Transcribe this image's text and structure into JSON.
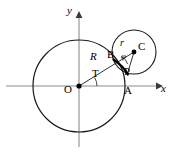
{
  "figure": {
    "background_color": "#ffffff",
    "stroke_color": "#1a1a1a",
    "axis_color": "#808080",
    "width": 180,
    "height": 153
  },
  "axes": {
    "x_label": "x",
    "y_label": "y",
    "origin_label": "O",
    "x_axis_y": 86,
    "y_axis_x": 79,
    "x_axis_start": 6,
    "x_axis_end": 160,
    "y_axis_top": 14,
    "y_axis_bottom": 147
  },
  "large_circle": {
    "name": "fixed-circle",
    "center_x": 79,
    "center_y": 86,
    "radius": 46,
    "radius_label": "R"
  },
  "small_circle": {
    "name": "rolling-circle",
    "center_x": 134,
    "center_y": 52,
    "radius": 22,
    "radius_label": "r",
    "center_label": "C"
  },
  "points": [
    {
      "label": "O",
      "x": 79,
      "y": 86,
      "dot": true,
      "label_x": 68,
      "label_y": 89
    },
    {
      "label": "A",
      "x": 125,
      "y": 86,
      "dot": false,
      "label_x": 126,
      "label_y": 90
    },
    {
      "label": "B",
      "x": 116,
      "y": 62,
      "dot": false,
      "label_x": 110,
      "label_y": 54
    },
    {
      "label": "P",
      "x": 127,
      "y": 74,
      "dot": false,
      "label_x": 125,
      "label_y": 73
    },
    {
      "label": "C",
      "x": 134,
      "y": 52,
      "dot": true,
      "label_x": 139,
      "label_y": 47
    }
  ],
  "angles": [
    {
      "label": "T",
      "name": "theta",
      "vertex": "O",
      "label_x": 94,
      "label_y": 74
    },
    {
      "label": "φ",
      "name": "phi",
      "vertex": "C",
      "label_x": 124,
      "label_y": 58
    }
  ],
  "segments": [
    {
      "name": "radius-R-segment",
      "from": "O",
      "to": "C",
      "label": "R"
    },
    {
      "name": "radius-r-segment",
      "from": "B",
      "to": "C",
      "label": "r"
    },
    {
      "name": "chord-CP-segment",
      "from": "C",
      "to": "P",
      "label": ""
    }
  ],
  "labels": {
    "R": {
      "text": "R",
      "x": 93,
      "y": 57,
      "italic": true,
      "size": 10
    },
    "r": {
      "text": "r",
      "x": 122,
      "y": 44,
      "italic": true,
      "size": 9
    },
    "C": {
      "text": "C",
      "x": 139,
      "y": 45,
      "italic": false,
      "size": 10
    },
    "B": {
      "text": "B",
      "x": 109,
      "y": 54,
      "italic": false,
      "size": 10
    },
    "P": {
      "text": "P",
      "x": 125,
      "y": 70,
      "italic": false,
      "size": 10
    },
    "A": {
      "text": "A",
      "x": 125,
      "y": 88,
      "italic": false,
      "size": 10
    },
    "O": {
      "text": "O",
      "x": 66,
      "y": 88,
      "italic": false,
      "size": 10
    },
    "T": {
      "text": "T",
      "x": 93,
      "y": 73,
      "italic": false,
      "size": 10
    },
    "phi": {
      "text": "φ",
      "x": 122,
      "y": 56,
      "italic": true,
      "size": 8
    },
    "x": {
      "text": "x",
      "x": 160,
      "y": 88,
      "italic": true,
      "size": 10
    },
    "y": {
      "text": "y",
      "x": 67,
      "y": 11,
      "italic": true,
      "size": 10
    }
  },
  "curve": {
    "name": "epicycloid-arc",
    "description": "bold arc traced from B through P"
  }
}
